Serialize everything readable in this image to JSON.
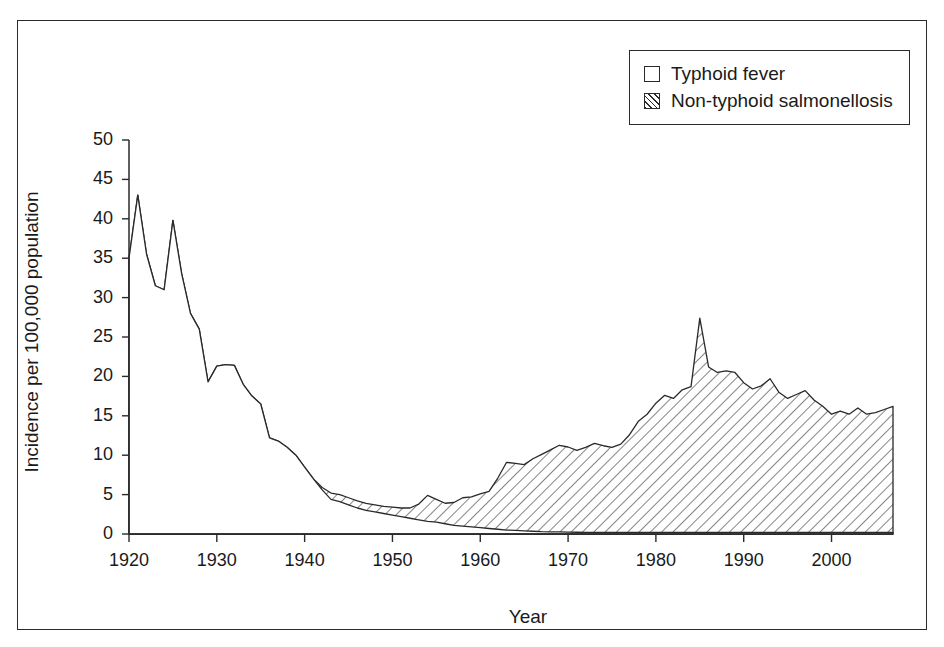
{
  "chart_data": {
    "type": "area",
    "title": "",
    "subtitle": "",
    "xlabel": "Year",
    "ylabel": "Incidence per 100,000 population",
    "xlim": [
      1920,
      2007
    ],
    "ylim": [
      0,
      50
    ],
    "xticks": [
      1920,
      1930,
      1940,
      1950,
      1960,
      1970,
      1980,
      1990,
      2000
    ],
    "yticks": [
      0,
      5,
      10,
      15,
      20,
      25,
      30,
      35,
      40,
      45,
      50
    ],
    "grid": false,
    "stacked": true,
    "legend_position": "top-right",
    "legend": [
      "Typhoid fever",
      "Non-typhoid salmonellosis"
    ],
    "annotations": [
      "Typhoid fever declines from about 43 per 100,000 in 1921 to near zero by 1960",
      "Non-typhoid salmonellosis emerges in the 1940s and rises through the 1980s",
      "Sharp spike to about 27 per 100,000 in 1985",
      "Final year value about 16 per 100,000"
    ],
    "x": [
      1920,
      1921,
      1922,
      1923,
      1924,
      1925,
      1926,
      1927,
      1928,
      1929,
      1930,
      1931,
      1932,
      1933,
      1934,
      1935,
      1936,
      1937,
      1938,
      1939,
      1940,
      1941,
      1942,
      1943,
      1944,
      1945,
      1946,
      1947,
      1948,
      1949,
      1950,
      1951,
      1952,
      1953,
      1954,
      1955,
      1956,
      1957,
      1958,
      1959,
      1960,
      1961,
      1962,
      1963,
      1964,
      1965,
      1966,
      1967,
      1968,
      1969,
      1970,
      1971,
      1972,
      1973,
      1974,
      1975,
      1976,
      1977,
      1978,
      1979,
      1980,
      1981,
      1982,
      1983,
      1984,
      1985,
      1986,
      1987,
      1988,
      1989,
      1990,
      1991,
      1992,
      1993,
      1994,
      1995,
      1996,
      1997,
      1998,
      1999,
      2000,
      2001,
      2002,
      2003,
      2004,
      2005,
      2006,
      2007
    ],
    "series": [
      {
        "name": "Typhoid fever",
        "pattern": "solid-white",
        "values": [
          35.0,
          43.0,
          35.5,
          31.5,
          31.0,
          39.8,
          33.0,
          28.0,
          26.0,
          19.3,
          21.3,
          21.5,
          21.4,
          19.0,
          17.5,
          16.5,
          12.2,
          11.8,
          11.0,
          10.0,
          8.5,
          7.0,
          5.6,
          4.4,
          4.1,
          3.7,
          3.3,
          3.0,
          2.8,
          2.6,
          2.4,
          2.2,
          2.0,
          1.8,
          1.6,
          1.5,
          1.3,
          1.1,
          1.0,
          0.9,
          0.8,
          0.7,
          0.6,
          0.5,
          0.45,
          0.4,
          0.35,
          0.3,
          0.28,
          0.26,
          0.24,
          0.22,
          0.2,
          0.2,
          0.2,
          0.2,
          0.2,
          0.2,
          0.2,
          0.2,
          0.2,
          0.2,
          0.2,
          0.2,
          0.2,
          0.2,
          0.2,
          0.2,
          0.2,
          0.2,
          0.2,
          0.2,
          0.2,
          0.2,
          0.2,
          0.2,
          0.2,
          0.2,
          0.2,
          0.2,
          0.2,
          0.2,
          0.2,
          0.2,
          0.2,
          0.2,
          0.2,
          0.2
        ]
      },
      {
        "name": "Non-typhoid salmonellosis",
        "pattern": "diagonal-hatch",
        "values": [
          0.0,
          0.0,
          0.0,
          0.0,
          0.0,
          0.0,
          0.0,
          0.0,
          0.0,
          0.0,
          0.0,
          0.0,
          0.0,
          0.0,
          0.0,
          0.0,
          0.0,
          0.0,
          0.0,
          0.0,
          0.0,
          0.0,
          0.3,
          0.8,
          0.9,
          0.9,
          0.9,
          0.9,
          0.9,
          0.9,
          1.0,
          1.1,
          1.3,
          2.0,
          3.3,
          2.9,
          2.6,
          2.9,
          3.6,
          3.8,
          4.3,
          4.7,
          6.5,
          8.6,
          8.5,
          8.4,
          9.2,
          9.8,
          10.4,
          11.0,
          10.8,
          10.4,
          10.8,
          11.3,
          11.0,
          10.8,
          11.2,
          12.4,
          14.1,
          15.0,
          16.4,
          17.4,
          17.0,
          18.1,
          18.5,
          27.2,
          21.0,
          20.3,
          20.5,
          20.3,
          19.0,
          18.2,
          18.6,
          19.5,
          17.8,
          17.0,
          17.5,
          18.0,
          16.8,
          16.0,
          15.0,
          15.4,
          15.0,
          15.8,
          15.0,
          15.2,
          15.6,
          16.0
        ]
      }
    ]
  },
  "legend": {
    "items": [
      {
        "label": "Typhoid fever",
        "swatch": "white-square"
      },
      {
        "label": "Non-typhoid salmonellosis",
        "swatch": "hatched-square"
      }
    ]
  },
  "axes": {
    "y_title": "Incidence per 100,000 population",
    "x_title": "Year",
    "y_tick_labels": [
      "50",
      "45",
      "40",
      "35",
      "30",
      "25",
      "20",
      "15",
      "10",
      "5",
      "0"
    ],
    "x_tick_labels": [
      "1920",
      "1930",
      "1940",
      "1950",
      "1960",
      "1970",
      "1980",
      "1990",
      "2000"
    ]
  },
  "colors": {
    "ink": "#2a2a2a",
    "background": "#ffffff",
    "hatch": "#2a2a2a"
  }
}
